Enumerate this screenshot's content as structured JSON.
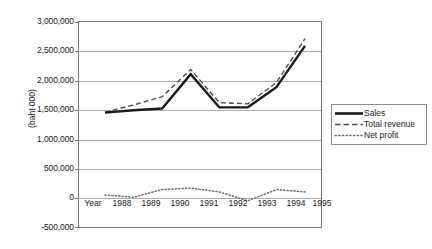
{
  "chart_data": {
    "type": "line",
    "title": "",
    "xlabel": "Year",
    "ylabel": "(baht 000)",
    "x": [
      "1988",
      "1989",
      "1990",
      "1991",
      "1992",
      "1993",
      "1994",
      "1995"
    ],
    "ylim": [
      -500000,
      3000000
    ],
    "ytick_labels": [
      "3,000,000",
      "2,500,000",
      "2,000,000",
      "1,500,000",
      "1,000,000",
      "500,000",
      "0",
      "-500,000"
    ],
    "ytick_values": [
      3000000,
      2500000,
      2000000,
      1500000,
      1000000,
      500000,
      0,
      -500000
    ],
    "grid": true,
    "legend_position": "right",
    "series": [
      {
        "name": "Sales",
        "style": "solid",
        "color": "#1a1a1a",
        "values": [
          1450000,
          1490000,
          1520000,
          2100000,
          1540000,
          1540000,
          1880000,
          2580000
        ]
      },
      {
        "name": "Total revenue",
        "style": "dashed",
        "color": "#4d4d4d",
        "values": [
          1460000,
          1580000,
          1720000,
          2180000,
          1620000,
          1600000,
          1960000,
          2700000
        ]
      },
      {
        "name": "Net profit",
        "style": "dotted",
        "color": "#6b6b6b",
        "values": [
          60000,
          20000,
          150000,
          175000,
          110000,
          -40000,
          150000,
          110000
        ]
      }
    ]
  },
  "legend": {
    "items": [
      {
        "label": "Sales"
      },
      {
        "label": "Total revenue"
      },
      {
        "label": "Net profit"
      }
    ]
  }
}
